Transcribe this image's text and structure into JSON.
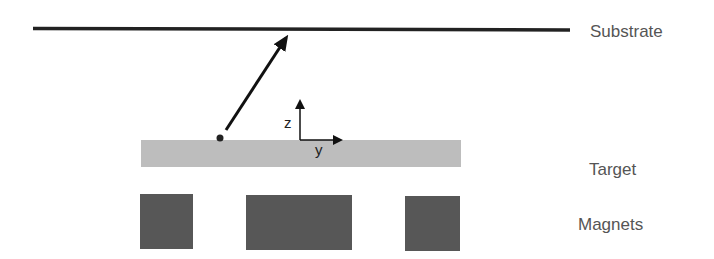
{
  "labels": {
    "substrate": "Substrate",
    "target": "Target",
    "magnets": "Magnets"
  },
  "axes": {
    "z": "z",
    "y": "y"
  },
  "colors": {
    "substrate_line": "#222222",
    "target_fill": "#bdbdbd",
    "magnet_fill": "#575757",
    "arrow": "#111111",
    "label_text": "#555555"
  }
}
